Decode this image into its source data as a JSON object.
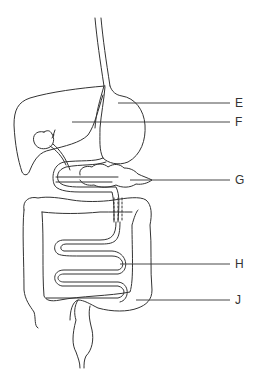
{
  "diagram": {
    "labels": [
      {
        "id": "E",
        "text": "E",
        "x": 236,
        "y": 103,
        "leader_from_x": 118
      },
      {
        "id": "F",
        "text": "F",
        "x": 236,
        "y": 122,
        "leader_from_x": 72
      },
      {
        "id": "G",
        "text": "G",
        "x": 236,
        "y": 180,
        "leader_from_x": 130
      },
      {
        "id": "H",
        "text": "H",
        "x": 236,
        "y": 264,
        "leader_from_x": 120
      },
      {
        "id": "J",
        "text": "J",
        "x": 236,
        "y": 300,
        "leader_from_x": 136
      }
    ],
    "colors": {
      "line": "#333333",
      "background": "#ffffff"
    }
  }
}
